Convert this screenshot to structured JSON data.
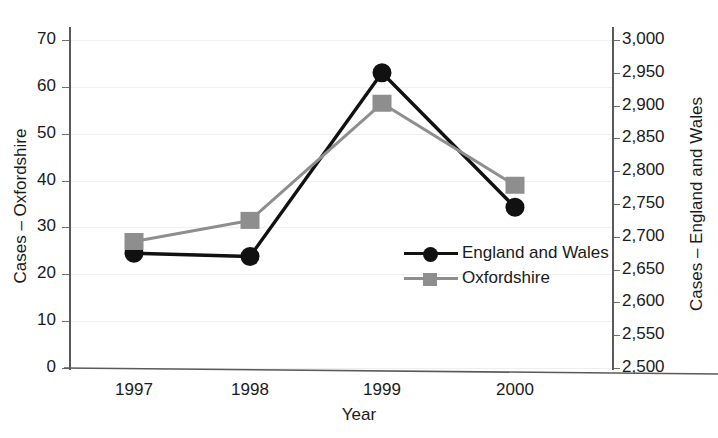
{
  "chart_data": {
    "type": "line",
    "title": "",
    "xlabel": "Year",
    "categories": [
      "1997",
      "1998",
      "1999",
      "2000"
    ],
    "grid": true,
    "legend_position": "center-right",
    "axes": {
      "left": {
        "label": "Cases – Oxfordshire",
        "ylim": [
          0,
          70
        ],
        "tick_step": 10,
        "ticks": [
          "0",
          "10",
          "20",
          "30",
          "40",
          "50",
          "60",
          "70"
        ]
      },
      "right": {
        "label": "Cases – England and Wales",
        "ylim": [
          2500,
          3000
        ],
        "tick_step": 50,
        "ticks": [
          "2,500",
          "2,550",
          "2,600",
          "2,650",
          "2,700",
          "2,750",
          "2,800",
          "2,850",
          "2,900",
          "2,950",
          "3,000"
        ]
      }
    },
    "series": [
      {
        "name": "England and Wales",
        "axis": "right",
        "marker": "circle",
        "color": "#111111",
        "values": [
          2675,
          2670,
          2950,
          2745
        ]
      },
      {
        "name": "Oxfordshire",
        "axis": "left",
        "marker": "square",
        "color": "#8e8e8e",
        "values": [
          27,
          31.5,
          56.5,
          39
        ]
      }
    ]
  },
  "legend": {
    "items": [
      {
        "label": "England and Wales",
        "marker": "circle",
        "color": "#111111"
      },
      {
        "label": "Oxfordshire",
        "marker": "square",
        "color": "#8e8e8e"
      }
    ]
  },
  "colors": {
    "england_wales": "#111111",
    "oxfordshire": "#8e8e8e",
    "axis": "#5a5a5a",
    "grid": "#efefef",
    "text": "#1a1a1a"
  }
}
